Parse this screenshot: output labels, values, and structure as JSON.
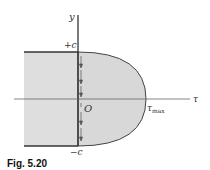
{
  "figure": {
    "caption": "Fig. 5.20",
    "labels": {
      "y_axis": "y",
      "x_axis": "τ",
      "top": "+c",
      "bottom": "−c",
      "origin": "O",
      "tau_max_main": "τ",
      "tau_max_sub": "max"
    },
    "colors": {
      "fill": "#dcdcdc",
      "stroke": "#333333",
      "axis": "#555555"
    }
  }
}
